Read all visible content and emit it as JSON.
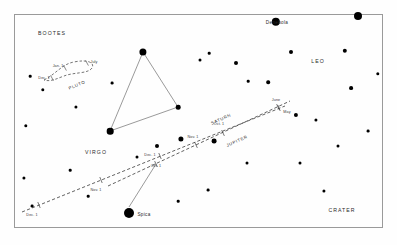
{
  "chart_data": {
    "type": "scatter",
    "title": "",
    "xlabel": "",
    "ylabel": "",
    "xlim": [
      0,
      397
    ],
    "ylim": [
      0,
      245
    ],
    "grid": false,
    "legend": "none",
    "constellations": [
      {
        "name": "BOOTES",
        "x": 52,
        "y": 33
      },
      {
        "name": "VIRGO",
        "x": 96,
        "y": 152
      },
      {
        "name": "LEO",
        "x": 318,
        "y": 61
      },
      {
        "name": "CRATER",
        "x": 342,
        "y": 210
      }
    ],
    "named_stars": [
      {
        "name": "Denebola",
        "x": 276,
        "y": 22,
        "label_x": 277,
        "label_y": 22,
        "r": 4.2
      },
      {
        "name": "Spica",
        "x": 129,
        "y": 213,
        "label_x": 144,
        "label_y": 214,
        "r": 5.0
      }
    ],
    "field_stars": [
      {
        "x": 30,
        "y": 76,
        "r": 1.3
      },
      {
        "x": 43,
        "y": 90,
        "r": 1.7
      },
      {
        "x": 76,
        "y": 107,
        "r": 1.6
      },
      {
        "x": 112,
        "y": 83,
        "r": 1.4
      },
      {
        "x": 143,
        "y": 52,
        "r": 3.6
      },
      {
        "x": 178,
        "y": 107,
        "r": 2.3
      },
      {
        "x": 110,
        "y": 131,
        "r": 3.3
      },
      {
        "x": 137,
        "y": 157,
        "r": 1.5
      },
      {
        "x": 157,
        "y": 146,
        "r": 2.0
      },
      {
        "x": 26,
        "y": 126,
        "r": 1.7
      },
      {
        "x": 24,
        "y": 178,
        "r": 1.6
      },
      {
        "x": 32,
        "y": 206,
        "r": 1.4
      },
      {
        "x": 70,
        "y": 170,
        "r": 1.3
      },
      {
        "x": 200,
        "y": 60,
        "r": 1.5
      },
      {
        "x": 209,
        "y": 53,
        "r": 1.3
      },
      {
        "x": 236,
        "y": 63,
        "r": 2.0
      },
      {
        "x": 248,
        "y": 81,
        "r": 1.3
      },
      {
        "x": 268,
        "y": 82,
        "r": 1.8
      },
      {
        "x": 291,
        "y": 52,
        "r": 2.0
      },
      {
        "x": 345,
        "y": 51,
        "r": 2.2
      },
      {
        "x": 351,
        "y": 88,
        "r": 1.9
      },
      {
        "x": 378,
        "y": 74,
        "r": 1.7
      },
      {
        "x": 358,
        "y": 16,
        "r": 4.0
      },
      {
        "x": 296,
        "y": 115,
        "r": 2.1
      },
      {
        "x": 316,
        "y": 120,
        "r": 1.6
      },
      {
        "x": 338,
        "y": 146,
        "r": 1.5
      },
      {
        "x": 368,
        "y": 131,
        "r": 1.4
      },
      {
        "x": 300,
        "y": 163,
        "r": 1.5
      },
      {
        "x": 324,
        "y": 191,
        "r": 1.6
      },
      {
        "x": 247,
        "y": 163,
        "r": 1.5
      },
      {
        "x": 208,
        "y": 190,
        "r": 1.4
      },
      {
        "x": 178,
        "y": 201,
        "r": 1.3
      },
      {
        "x": 88,
        "y": 196,
        "r": 1.3
      },
      {
        "x": 214,
        "y": 141,
        "r": 2.4
      },
      {
        "x": 181,
        "y": 139,
        "r": 2.6
      }
    ],
    "asterism": {
      "name": "virgo-triangle",
      "vertices": [
        {
          "x": 143,
          "y": 52
        },
        {
          "x": 178,
          "y": 107
        },
        {
          "x": 110,
          "y": 131
        }
      ]
    },
    "planet_tracks": [
      {
        "name": "SATURN",
        "label_x": 221,
        "label_y": 119,
        "label_rotate": -24,
        "path": [
          {
            "x": 22,
            "y": 212
          },
          {
            "x": 285,
            "y": 106
          }
        ],
        "ticks": [
          {
            "date": "Dec. 1",
            "x": 39,
            "y": 205,
            "label_x": 32,
            "label_y": 215
          },
          {
            "date": "Nov. 1",
            "x": 101,
            "y": 180,
            "label_x": 96,
            "label_y": 190
          },
          {
            "date": "Oct. 1",
            "x": 160,
            "y": 156,
            "label_x": 156,
            "label_y": 166
          },
          {
            "date": "May",
            "x": 279,
            "y": 108,
            "label_x": 287,
            "label_y": 112
          }
        ]
      },
      {
        "name": "JUPITER",
        "label_x": 237,
        "label_y": 141,
        "label_rotate": -24,
        "path": [
          {
            "x": 108,
            "y": 186
          },
          {
            "x": 290,
            "y": 101
          }
        ],
        "ticks": [
          {
            "date": "Dec. 1",
            "x": 156,
            "y": 164,
            "label_x": 150,
            "label_y": 155
          },
          {
            "date": "Nov. 1",
            "x": 196,
            "y": 145,
            "label_x": 193,
            "label_y": 137
          },
          {
            "date": "Oct. 1",
            "x": 223,
            "y": 133,
            "label_x": 219,
            "label_y": 124
          },
          {
            "date": "June",
            "x": 278,
            "y": 107,
            "label_x": 276,
            "label_y": 100
          }
        ]
      },
      {
        "name": "PLUTO",
        "label_x": 77,
        "label_y": 85,
        "label_rotate": -22,
        "loop": true,
        "ticks": [
          {
            "date": "Jan. 1",
            "x": 65,
            "y": 68,
            "label_x": 58,
            "label_y": 66
          },
          {
            "date": "July",
            "x": 87,
            "y": 63,
            "label_x": 94,
            "label_y": 62
          },
          {
            "date": "Dec. 1",
            "x": 52,
            "y": 78,
            "label_x": 44,
            "label_y": 78
          }
        ]
      }
    ],
    "leader_lines": [
      {
        "from": {
          "x": 129,
          "y": 207
        },
        "to": {
          "x": 156,
          "y": 164
        },
        "name": "spica-to-saturn-track"
      }
    ],
    "colors": {
      "background": "#fefefe",
      "star": "#000000",
      "frame": "#9a9a9a",
      "track": "#3a3a3a",
      "asterism_line": "#555555",
      "text": "#2a2a2a"
    }
  }
}
